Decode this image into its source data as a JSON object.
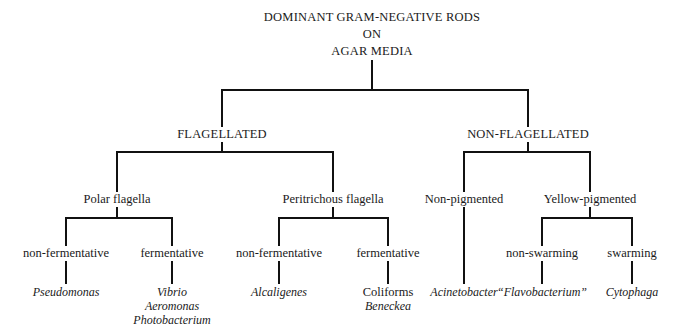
{
  "diagram": {
    "type": "classification-tree",
    "title": [
      "DOMINANT GRAM-NEGATIVE RODS",
      "ON",
      "AGAR MEDIA"
    ],
    "level1": [
      {
        "label": "FLAGELLATED"
      },
      {
        "label": "NON-FLAGELLATED"
      }
    ],
    "level2": [
      {
        "label": "Polar flagella",
        "parent": "FLAGELLATED"
      },
      {
        "label": "Peritrichous flagella",
        "parent": "FLAGELLATED"
      },
      {
        "label": "Non-pigmented",
        "parent": "NON-FLAGELLATED"
      },
      {
        "label": "Yellow-pigmented",
        "parent": "NON-FLAGELLATED"
      }
    ],
    "level3": [
      {
        "label": "non-fermentative",
        "parent": "Polar flagella"
      },
      {
        "label": "fermentative",
        "parent": "Polar flagella"
      },
      {
        "label": "non-fermentative",
        "parent": "Peritrichous flagella"
      },
      {
        "label": "fermentative",
        "parent": "Peritrichous flagella"
      },
      {
        "label": "non-swarming",
        "parent": "Yellow-pigmented"
      },
      {
        "label": "swarming",
        "parent": "Yellow-pigmented"
      }
    ],
    "leaves": [
      {
        "lines": [
          "Pseudomonas"
        ]
      },
      {
        "lines": [
          "Vibrio",
          "Aeromonas",
          "Photobacterium"
        ]
      },
      {
        "lines": [
          "Alcaligenes"
        ]
      },
      {
        "lines": [
          "Coliforms",
          "Beneckea"
        ]
      },
      {
        "lines": [
          "Acinetobacter"
        ]
      },
      {
        "lines": [
          "“Flavobacterium”"
        ]
      },
      {
        "lines": [
          "Cytophaga"
        ]
      }
    ],
    "line_color": "#111111"
  }
}
